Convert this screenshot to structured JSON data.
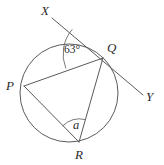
{
  "diagram": {
    "type": "circle-geometry",
    "background_color": "#ffffff",
    "stroke_color": "#5a5a5a",
    "label_color": "#2b2b2b",
    "canvas": {
      "width": 164,
      "height": 165
    },
    "circle": {
      "cx": 69,
      "cy": 93,
      "r": 49
    },
    "points": [
      {
        "name": "P",
        "label": "P",
        "x": 24,
        "y": 86,
        "label_x": 6,
        "label_y": 79,
        "on_circle": true
      },
      {
        "name": "Q",
        "label": "Q",
        "x": 103,
        "y": 58,
        "label_x": 107,
        "label_y": 41,
        "on_circle": true
      },
      {
        "name": "R",
        "label": "R",
        "x": 79,
        "y": 142,
        "label_x": 75,
        "label_y": 148,
        "on_circle": true
      },
      {
        "name": "X",
        "label": "X",
        "x": 52,
        "y": 18,
        "label_x": 41,
        "label_y": 4,
        "on_circle": false
      },
      {
        "name": "Y",
        "label": "Y",
        "x": 143,
        "y": 95,
        "label_x": 146,
        "label_y": 90,
        "on_circle": false
      }
    ],
    "segments": [
      {
        "name": "chord-PQ",
        "from": "P",
        "to": "Q"
      },
      {
        "name": "chord-PR",
        "from": "P",
        "to": "R"
      },
      {
        "name": "chord-QR",
        "from": "Q",
        "to": "R"
      },
      {
        "name": "line-XY",
        "from": "X",
        "to": "Y",
        "through": "Q"
      }
    ],
    "angles": [
      {
        "name": "angle-at-Q",
        "vertex": "Q",
        "label": "63°",
        "value": 63,
        "unit": "degrees",
        "between": [
          "QX",
          "QP"
        ],
        "label_x": 64,
        "label_y": 44,
        "arc_radius": 38
      },
      {
        "name": "angle-at-R",
        "vertex": "R",
        "label": "a",
        "value": null,
        "unit": "unknown",
        "between": [
          "RP",
          "RQ"
        ],
        "label_x": 73,
        "label_y": 119,
        "arc_radius": 23
      }
    ]
  }
}
